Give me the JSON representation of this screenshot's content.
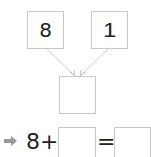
{
  "diagram": {
    "top_left_value": "8",
    "top_right_value": "1",
    "result_box_value": "",
    "equation": {
      "arrow_icon": "right-arrow",
      "first_term": "8",
      "plus": "+",
      "blank1": "",
      "equals": "=",
      "blank2": ""
    },
    "colors": {
      "box_border": "#c8c8c8",
      "connector": "#d0d0d0",
      "arrow": "#999999",
      "text": "#222222"
    }
  }
}
